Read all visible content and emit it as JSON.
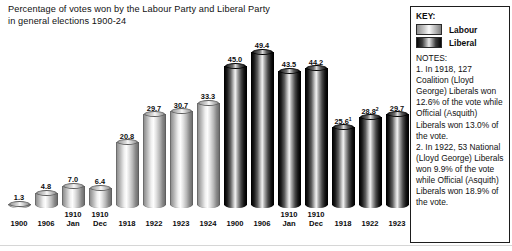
{
  "title": {
    "line1": "Percentage of votes won by the Labour Party and Liberal Party",
    "line2": "in general elections 1900-24"
  },
  "key": {
    "heading": "KEY:",
    "entries": [
      {
        "label": "Labour",
        "swatch": "labour-gradient-swatch"
      },
      {
        "label": "Liberal",
        "swatch": "liberal-gradient-swatch"
      }
    ]
  },
  "notes": {
    "heading": "NOTES:",
    "items": [
      "1. In 1918, 127 Coalition (Lloyd George) Liberals won 12.6% of the vote while Official (Asquith) Liberals won 13.0% of the vote.",
      "2. In 1922, 53 National (Lloyd George) Liberals won 9.9% of the vote while Official (Asquith) Liberals won 18.9% of the vote."
    ]
  },
  "chart_data": {
    "type": "bar",
    "title": "Percentage of votes won by the Labour Party and Liberal Party in general elections 1900-24",
    "xlabel": "",
    "ylabel": "",
    "ylim": [
      0,
      50
    ],
    "grid": false,
    "legend_position": "right",
    "categories": [
      "1900",
      "1906",
      "1910 Jan",
      "1910 Dec",
      "1918",
      "1922",
      "1923",
      "1924"
    ],
    "category_labels": [
      {
        "main": "1900",
        "sub": ""
      },
      {
        "main": "1906",
        "sub": ""
      },
      {
        "main": "1910",
        "sub": "Jan"
      },
      {
        "main": "1910",
        "sub": "Dec"
      },
      {
        "main": "1918",
        "sub": ""
      },
      {
        "main": "1922",
        "sub": ""
      },
      {
        "main": "1923",
        "sub": ""
      },
      {
        "main": "1924",
        "sub": ""
      }
    ],
    "series": [
      {
        "name": "Labour",
        "values": [
          1.3,
          4.8,
          7.0,
          6.4,
          20.8,
          29.7,
          30.7,
          33.3
        ],
        "labels": [
          "1.3",
          "4.8",
          "7.0",
          "6.4",
          "20.8",
          "29.7",
          "30.7",
          "33.3"
        ],
        "footnotes": [
          "",
          "",
          "",
          "",
          "",
          "",
          "",
          ""
        ]
      },
      {
        "name": "Liberal",
        "values": [
          45.0,
          49.4,
          43.5,
          44.2,
          25.6,
          28.8,
          29.7,
          17.8
        ],
        "labels": [
          "45.0",
          "49.4",
          "43.5",
          "44.2",
          "25.6",
          "28.8",
          "29.7",
          "17.8"
        ],
        "footnotes": [
          "",
          "",
          "",
          "",
          "1",
          "2",
          "",
          ""
        ]
      }
    ],
    "annotations": [
      "1. In 1918, 127 Coalition (Lloyd George) Liberals won 12.6% of the vote while Official (Asquith) Liberals won 13.0% of the vote.",
      "2. In 1922, 53 National (Lloyd George) Liberals won 9.9% of the vote while Official (Asquith) Liberals won 18.9% of the vote."
    ]
  }
}
